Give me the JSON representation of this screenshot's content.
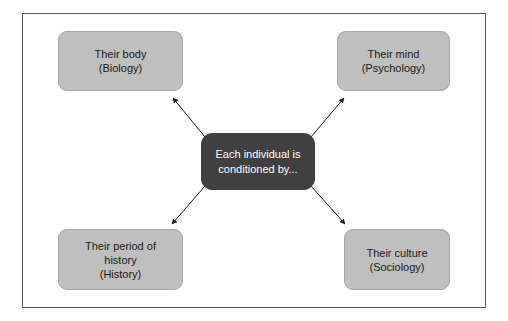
{
  "diagram": {
    "title": "Each individual is conditioned by",
    "center": {
      "id": "center-node",
      "label": "Each individual is\nconditioned by...",
      "fill": "#404040",
      "text_color": "#ffffff"
    },
    "nodes": [
      {
        "id": "node-biology",
        "position": "top-left",
        "label": "Their body\n(Biology)",
        "concept": "Their body",
        "discipline": "(Biology)",
        "fill": "#bfbfbf",
        "text_color": "#1a1a1a"
      },
      {
        "id": "node-psychology",
        "position": "top-right",
        "label": "Their mind\n(Psychology)",
        "concept": "Their mind",
        "discipline": "(Psychology)",
        "fill": "#bfbfbf",
        "text_color": "#1a1a1a"
      },
      {
        "id": "node-history",
        "position": "bottom-left",
        "label": "Their period of\nhistory\n(History)",
        "concept": "Their period of history",
        "discipline": "(History)",
        "fill": "#bfbfbf",
        "text_color": "#1a1a1a"
      },
      {
        "id": "node-sociology",
        "position": "bottom-right",
        "label": "Their culture\n(Sociology)",
        "concept": "Their culture",
        "discipline": "(Sociology)",
        "fill": "#bfbfbf",
        "text_color": "#1a1a1a"
      }
    ],
    "connectors": [
      {
        "id": "arrow-to-biology",
        "from": "center-node",
        "to": "node-biology",
        "style": "solid-thin",
        "arrowhead": "filled-triangle",
        "color": "#1a1a1a"
      },
      {
        "id": "arrow-to-psychology",
        "from": "center-node",
        "to": "node-psychology",
        "style": "solid-thin",
        "arrowhead": "filled-triangle",
        "color": "#1a1a1a"
      },
      {
        "id": "arrow-to-history",
        "from": "center-node",
        "to": "node-history",
        "style": "solid-thin",
        "arrowhead": "filled-triangle",
        "color": "#1a1a1a"
      },
      {
        "id": "arrow-to-sociology",
        "from": "center-node",
        "to": "node-sociology",
        "style": "solid-thin",
        "arrowhead": "filled-triangle",
        "color": "#1a1a1a"
      }
    ],
    "frame": {
      "border_color": "#595959",
      "background": "#ffffff"
    }
  }
}
